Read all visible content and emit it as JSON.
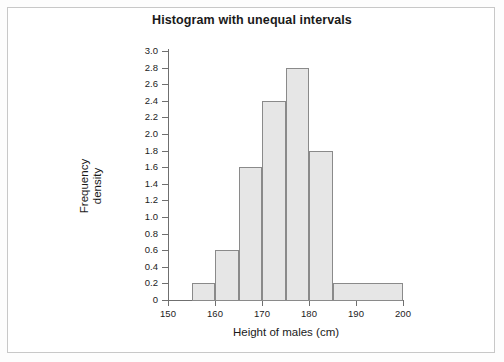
{
  "chart_data": {
    "type": "bar",
    "title": "Histogram with unequal intervals",
    "xlabel": "Height of males (cm)",
    "ylabel_line1": "Frequency",
    "ylabel_line2": "density",
    "xlim": [
      150,
      200
    ],
    "ylim": [
      0,
      3.0
    ],
    "grid": false,
    "legend": null,
    "xticks": [
      150,
      160,
      170,
      180,
      190,
      200
    ],
    "xtick_labels": [
      "150",
      "160",
      "170",
      "180",
      "190",
      "200"
    ],
    "yticks": [
      0,
      0.2,
      0.4,
      0.6,
      0.8,
      1.0,
      1.2,
      1.4,
      1.6,
      1.8,
      2.0,
      2.2,
      2.4,
      2.6,
      2.8,
      3.0
    ],
    "ytick_labels": [
      "0",
      "0.2",
      "0.4",
      "0.6",
      "0.8",
      "1.0",
      "1.2",
      "1.4",
      "1.6",
      "1.8",
      "2.0",
      "2.2",
      "2.4",
      "2.6",
      "2.8",
      "3.0"
    ],
    "bar_fill": "#e6e6e6",
    "bar_edge": "#8a8a8a",
    "bins": [
      {
        "x0": 155,
        "x1": 160,
        "density": 0.2
      },
      {
        "x0": 160,
        "x1": 165,
        "density": 0.6
      },
      {
        "x0": 165,
        "x1": 170,
        "density": 1.6
      },
      {
        "x0": 170,
        "x1": 175,
        "density": 2.4
      },
      {
        "x0": 175,
        "x1": 180,
        "density": 2.8
      },
      {
        "x0": 180,
        "x1": 185,
        "density": 1.8
      },
      {
        "x0": 185,
        "x1": 200,
        "density": 0.2
      }
    ]
  }
}
